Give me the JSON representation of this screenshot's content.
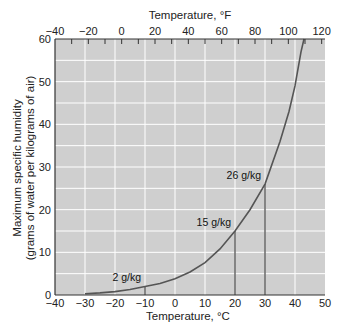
{
  "chart_data": {
    "type": "line",
    "title": "",
    "xlabel": "Temperature, °C",
    "x2label": "Temperature, °F",
    "ylabel_line1": "Maximum specific humidity",
    "ylabel_line2": "(grams of water per kilograms of air)",
    "xlim": [
      -40,
      50
    ],
    "ylim": [
      0,
      60
    ],
    "x_ticks": [
      -40,
      -30,
      -20,
      -10,
      0,
      10,
      20,
      30,
      40,
      50
    ],
    "x2_ticks": [
      -40,
      -20,
      0,
      20,
      40,
      60,
      80,
      100,
      120
    ],
    "y_ticks": [
      0,
      10,
      20,
      30,
      40,
      50,
      60
    ],
    "grid": true,
    "background": "#cfcfcf",
    "grid_color": "#ffffff",
    "curve_color": "#555555",
    "series": [
      {
        "name": "Saturation specific humidity",
        "x": [
          -30,
          -25,
          -20,
          -15,
          -10,
          -5,
          0,
          5,
          10,
          15,
          20,
          25,
          30,
          35,
          38,
          40,
          42,
          43
        ],
        "y": [
          0.3,
          0.5,
          0.8,
          1.3,
          2,
          2.7,
          3.8,
          5.4,
          7.6,
          10.8,
          15,
          20,
          26,
          36,
          43,
          49,
          57,
          62
        ]
      }
    ],
    "annotations": [
      {
        "label": "2 g/kg",
        "x": -10,
        "y": 2
      },
      {
        "label": "15 g/kg",
        "x": 20,
        "y": 15
      },
      {
        "label": "26 g/kg",
        "x": 30,
        "y": 26
      }
    ]
  }
}
